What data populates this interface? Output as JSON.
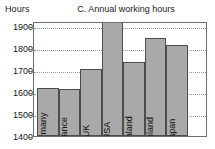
{
  "axis_unit_label": "Hours",
  "title": "C. Annual working hours",
  "colors": {
    "bar_fill": "#a9a9a9",
    "bar_border": "#4d4d4d",
    "frame": "#6e6e6e",
    "gridline": "#9a9a9a",
    "text": "#1a1a1a",
    "background": "#ffffff"
  },
  "chart_data": {
    "type": "bar",
    "title": "C. Annual working hours",
    "xlabel": "",
    "ylabel": "Hours",
    "ylim": [
      1400,
      1925
    ],
    "yticks": [
      1400,
      1500,
      1600,
      1700,
      1800,
      1900
    ],
    "ytick_labels": [
      "1400",
      "1500",
      "1600",
      "1700",
      "1800",
      "1900"
    ],
    "grid": true,
    "legend": false,
    "note": "USA bar is clipped at the top of the plot area",
    "categories": [
      "Germany",
      "France",
      "UK",
      "USA",
      "Finland",
      "Poland",
      "Japan"
    ],
    "values": [
      1615,
      1610,
      1703,
      1925,
      1732,
      1841,
      1812
    ]
  }
}
